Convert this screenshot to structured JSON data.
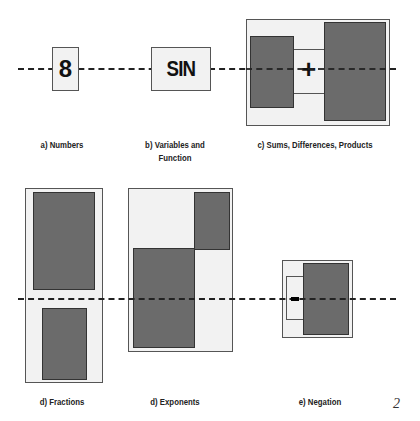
{
  "figure": {
    "row1": {
      "numbers": {
        "symbol": "8",
        "label": "a) Numbers"
      },
      "variables": {
        "symbol": "SIN",
        "label_line1": "b) Variables and",
        "label_line2": "Function"
      },
      "sums": {
        "operator": "+",
        "label": "c) Sums, Differences, Products"
      }
    },
    "row2": {
      "fractions": {
        "label": "d) Fractions"
      },
      "exponents": {
        "label": "d) Exponents"
      },
      "negation": {
        "label": "e) Negation"
      }
    },
    "page_number": "2",
    "colors": {
      "box_fill": "#f2f2f2",
      "block_fill": "#6b6b6b",
      "baseline": "#222222"
    }
  }
}
